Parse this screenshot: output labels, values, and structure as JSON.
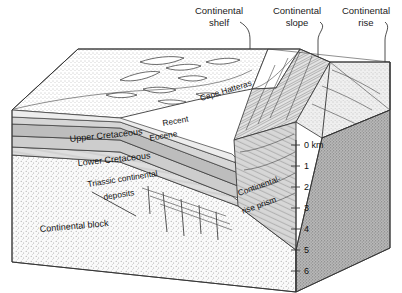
{
  "figure": {
    "type": "geologic-block-diagram"
  },
  "callouts": [
    {
      "id": "shelf",
      "line1": "Continental",
      "line2": "shelf"
    },
    {
      "id": "slope",
      "line1": "Continental",
      "line2": "slope"
    },
    {
      "id": "rise",
      "line1": "Continental",
      "line2": "rise"
    }
  ],
  "map_labels": {
    "cape": "Cape Hatteras"
  },
  "strata": [
    {
      "id": "recent",
      "label": "Recent"
    },
    {
      "id": "eocene",
      "label": "Eocene"
    },
    {
      "id": "upper-cretaceous",
      "label": "Upper Cretaceous"
    },
    {
      "id": "lower-cretaceous",
      "label": "Lower Cretaceous"
    },
    {
      "id": "triassic",
      "label_line1": "Triassic continental",
      "label_line2": "deposits"
    },
    {
      "id": "continental-block",
      "label": "Continental block"
    }
  ],
  "prism": {
    "label_line1": "Continental-",
    "label_line2": "rise prism"
  },
  "depth_scale": {
    "unit": "km",
    "ticks": [
      {
        "value": "0",
        "label": "0  km"
      },
      {
        "value": "1",
        "label": "1"
      },
      {
        "value": "2",
        "label": "2"
      },
      {
        "value": "3",
        "label": "3"
      },
      {
        "value": "4",
        "label": "4"
      },
      {
        "value": "5",
        "label": "5"
      },
      {
        "value": "6",
        "label": "6"
      }
    ]
  },
  "colors": {
    "ink": "#222222",
    "land_stipple": "#d9d9d9",
    "layer_light": "#e2e2e2",
    "layer_mid": "#c9c9c9",
    "layer_dark": "#b4b4b4",
    "basement": "#dcdcdc",
    "right_face": "#9b9b9b",
    "seafloor": "#cfcfcf",
    "background": "#ffffff"
  }
}
